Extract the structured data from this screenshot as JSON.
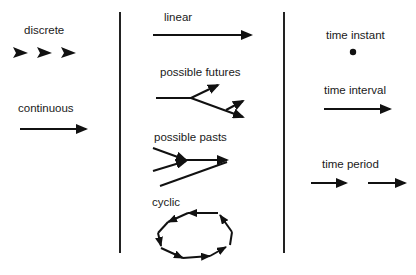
{
  "diagram": {
    "left_column": {
      "discrete": {
        "label": "discrete",
        "symbol": "three separate arrowheads"
      },
      "continuous": {
        "label": "continuous",
        "symbol": "arrow"
      }
    },
    "middle_column": {
      "linear": {
        "label": "linear",
        "symbol": "single arrow"
      },
      "possible_futures": {
        "label": "possible futures",
        "symbol": "branching arrow forking forward"
      },
      "possible_pasts": {
        "label": "possible pasts",
        "symbol": "converging arrows merging forward"
      },
      "cyclic": {
        "label": "cyclic",
        "symbol": "closed loop of arrows"
      }
    },
    "right_column": {
      "time_instant": {
        "label": "time instant",
        "symbol": "dot"
      },
      "time_interval": {
        "label": "time interval",
        "symbol": "arrow"
      },
      "time_period": {
        "label": "time period",
        "symbol": "two short arrows"
      }
    },
    "colors": {
      "ink": "#111111",
      "background": "#ffffff"
    }
  }
}
